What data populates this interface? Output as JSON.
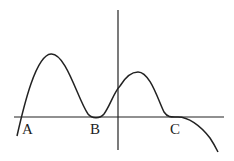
{
  "diagram": {
    "type": "function-graph",
    "points": [
      {
        "label": "A",
        "x": 21,
        "y": 117,
        "label_x": 22,
        "label_y": 134
      },
      {
        "label": "B",
        "x": 96,
        "y": 117,
        "label_x": 90,
        "label_y": 134
      },
      {
        "label": "C",
        "x": 175,
        "y": 117,
        "label_x": 170,
        "label_y": 134
      }
    ],
    "colors": {
      "line": "#222222",
      "background": "#ffffff"
    }
  }
}
